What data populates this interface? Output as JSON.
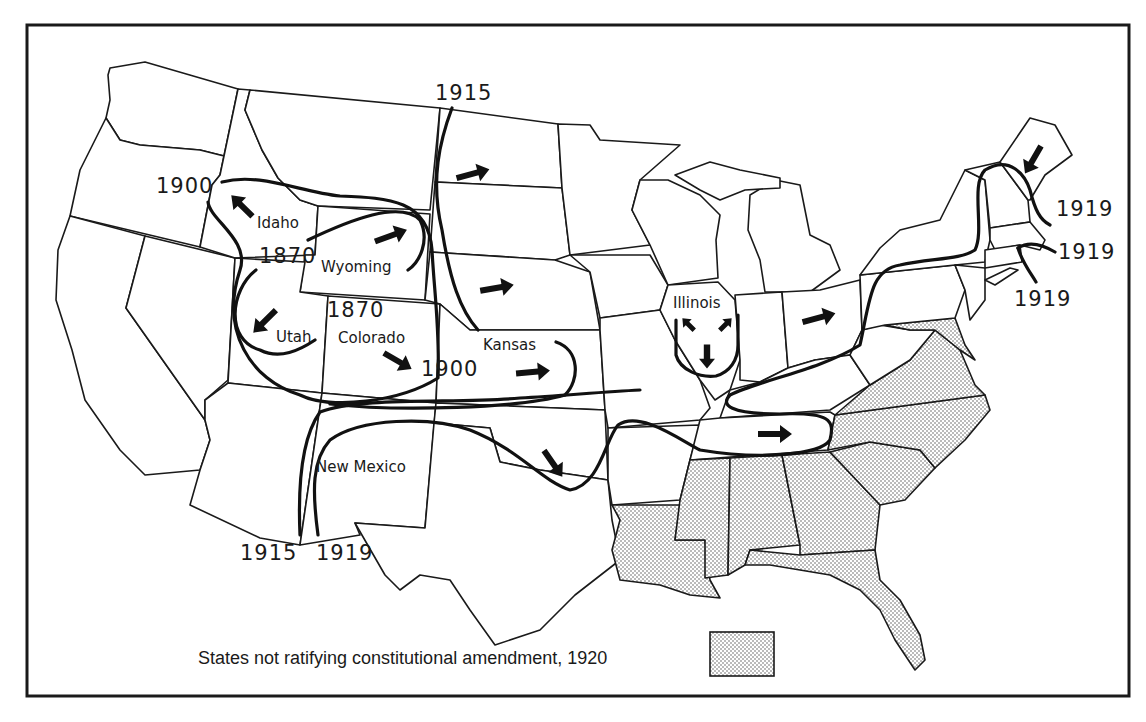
{
  "map": {
    "title": "Spread of women's suffrage in the United States",
    "state_labels": [
      {
        "id": "idaho",
        "text": "Idaho",
        "x": 257,
        "y": 228
      },
      {
        "id": "wyoming",
        "text": "Wyoming",
        "x": 321,
        "y": 272
      },
      {
        "id": "utah",
        "text": "Utah",
        "x": 276,
        "y": 342
      },
      {
        "id": "colorado",
        "text": "Colorado",
        "x": 338,
        "y": 343
      },
      {
        "id": "kansas",
        "text": "Kansas",
        "x": 483,
        "y": 350
      },
      {
        "id": "illinois",
        "text": "Illinois",
        "x": 673,
        "y": 308
      },
      {
        "id": "new-mexico",
        "text": "New Mexico",
        "x": 316,
        "y": 472
      }
    ],
    "year_labels": [
      {
        "id": "year-1900-oregon",
        "text": "1900",
        "x": 156,
        "y": 193
      },
      {
        "id": "year-1870-wyoming",
        "text": "1870",
        "x": 259,
        "y": 263
      },
      {
        "id": "year-1870-utah",
        "text": "1870",
        "x": 327,
        "y": 317
      },
      {
        "id": "year-1900-colorado",
        "text": "1900",
        "x": 421,
        "y": 376
      },
      {
        "id": "year-1915-north",
        "text": "1915",
        "x": 435,
        "y": 100
      },
      {
        "id": "year-1915-south",
        "text": "1915",
        "x": 240,
        "y": 560
      },
      {
        "id": "year-1919-south",
        "text": "1919",
        "x": 316,
        "y": 560
      },
      {
        "id": "year-1919-maine",
        "text": "1919",
        "x": 1056,
        "y": 216
      },
      {
        "id": "year-1919-mass",
        "text": "1919",
        "x": 1058,
        "y": 259
      },
      {
        "id": "year-1919-ny",
        "text": "1919",
        "x": 1014,
        "y": 306
      }
    ],
    "legend": {
      "label": "States not ratifying constitutional amendment, 1920",
      "pattern": "stipple"
    },
    "non_ratifying_states": [
      "Maryland",
      "Delaware",
      "Virginia",
      "North Carolina",
      "South Carolina",
      "Georgia",
      "Florida",
      "Alabama",
      "Mississippi",
      "Louisiana"
    ],
    "colors": {
      "ink": "#1a1a1a",
      "paper": "#ffffff",
      "stipple_dot": "#555555"
    }
  }
}
